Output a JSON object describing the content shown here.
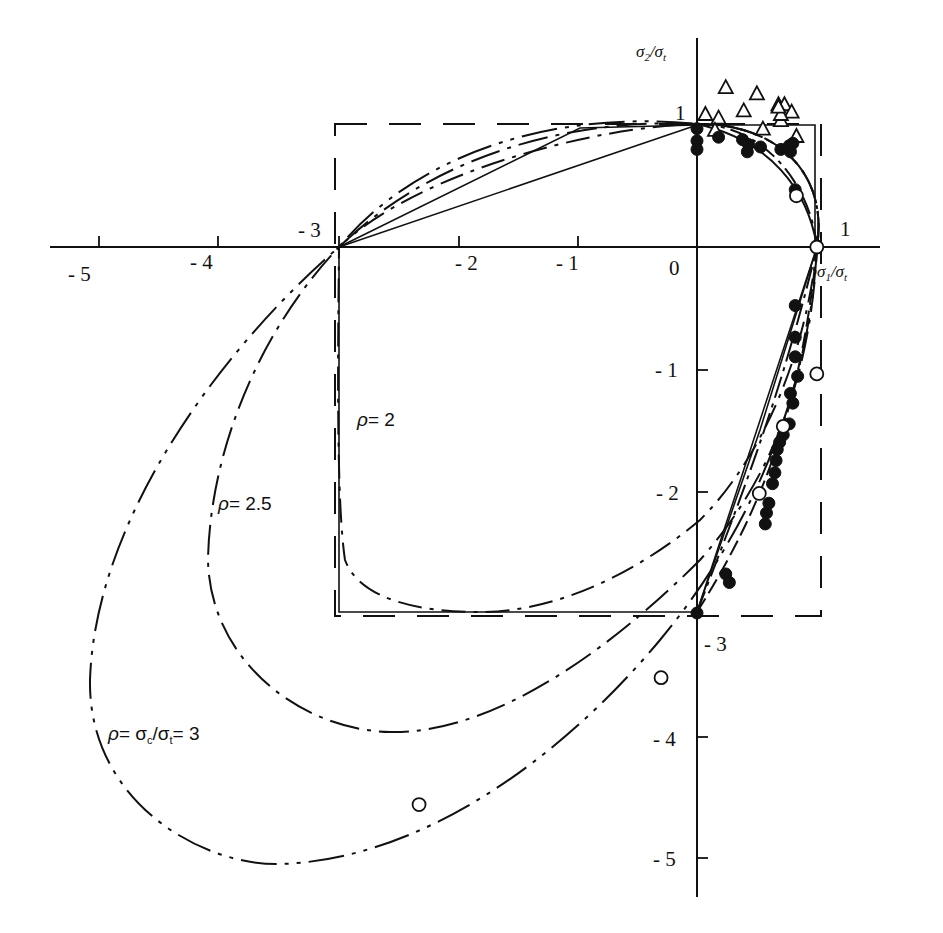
{
  "chart_data": {
    "type": "scatter",
    "title": "",
    "xlabel": "σ1/σt",
    "ylabel": "σ2/σt",
    "xlim": [
      -5.3,
      1.45
    ],
    "ylim": [
      -5.4,
      1.35
    ],
    "grid": false,
    "legend": null,
    "x_ticks": [
      -5,
      -4,
      -3,
      -2,
      -1,
      0,
      1
    ],
    "x_tick_labels": [
      "- 5",
      "- 4",
      "- 3",
      "- 2",
      "- 1",
      "0",
      "1"
    ],
    "y_ticks": [
      1,
      -1,
      -2,
      -3,
      -4,
      -5
    ],
    "y_tick_labels": [
      "1",
      "- 1",
      "- 2",
      "- 3",
      "- 4",
      "- 5"
    ],
    "reference_box": {
      "style": "dashed",
      "x": [
        -3,
        1
      ],
      "y": [
        -3,
        1
      ]
    },
    "curves": [
      {
        "name": "ρ = 2",
        "style": "dash-dot",
        "label": "ρ = 2"
      },
      {
        "name": "ρ = 2.5",
        "style": "dash-dot",
        "label": "ρ = 2.5"
      },
      {
        "name": "ρ = σc/σt = 3",
        "style": "dash-dot",
        "label": "ρ = σc/σt = 3"
      }
    ],
    "series": [
      {
        "name": "open triangles",
        "marker": "triangle-open",
        "points": [
          [
            0.07,
            1.09
          ],
          [
            0.24,
            1.31
          ],
          [
            0.39,
            1.12
          ],
          [
            0.5,
            1.26
          ],
          [
            0.68,
            1.17
          ],
          [
            0.7,
            1.04
          ],
          [
            0.73,
            1.17
          ],
          [
            0.79,
            1.11
          ],
          [
            0.7,
            1.09
          ],
          [
            0.68,
            1.15
          ],
          [
            0.55,
            0.97
          ],
          [
            0.18,
            1.06
          ],
          [
            0.15,
            0.96
          ],
          [
            0.83,
            0.91
          ]
        ]
      },
      {
        "name": "filled circles",
        "marker": "circle-filled",
        "points": [
          [
            0.0,
            0.97
          ],
          [
            0.0,
            0.87
          ],
          [
            0.0,
            0.8
          ],
          [
            0.18,
            0.9
          ],
          [
            0.38,
            0.88
          ],
          [
            0.43,
            0.84
          ],
          [
            0.42,
            0.78
          ],
          [
            0.53,
            0.82
          ],
          [
            0.7,
            0.8
          ],
          [
            0.77,
            0.83
          ],
          [
            0.8,
            0.85
          ],
          [
            0.78,
            0.78
          ],
          [
            0.82,
            0.47
          ],
          [
            0.82,
            -0.48
          ],
          [
            0.82,
            -0.74
          ],
          [
            0.82,
            -0.9
          ],
          [
            0.84,
            -1.06
          ],
          [
            0.78,
            -1.2
          ],
          [
            0.8,
            -1.28
          ],
          [
            0.77,
            -1.45
          ],
          [
            0.72,
            -1.54
          ],
          [
            0.69,
            -1.6
          ],
          [
            0.67,
            -1.66
          ],
          [
            0.66,
            -1.75
          ],
          [
            0.65,
            -1.85
          ],
          [
            0.63,
            -1.94
          ],
          [
            0.6,
            -2.1
          ],
          [
            0.58,
            -2.18
          ],
          [
            0.57,
            -2.27
          ],
          [
            0.24,
            -2.68
          ],
          [
            0.27,
            -2.75
          ],
          [
            0.0,
            -3.0
          ]
        ]
      },
      {
        "name": "open circles",
        "marker": "circle-open",
        "points": [
          [
            0.83,
            0.42
          ],
          [
            1.0,
            0.0
          ],
          [
            1.0,
            -1.04
          ],
          [
            0.72,
            -1.47
          ],
          [
            0.52,
            -2.02
          ],
          [
            -0.3,
            -3.53
          ],
          [
            -2.32,
            -4.57
          ]
        ]
      }
    ]
  },
  "axes": {
    "x_title_main": "σ",
    "x_title_sub1": "1",
    "x_title_mid": "/σ",
    "x_title_sub2": "t",
    "y_title_main": "σ",
    "y_title_sub1": "2",
    "y_title_mid": "/σ",
    "y_title_sub2": "t"
  },
  "labels": {
    "rho2": "= 2",
    "rho25": "= 2.5",
    "rho3_mid": "= σ",
    "rho3_sub": "c",
    "rho3_mid2": "/σ",
    "rho3_sub2": "t",
    "rho3_end": "= 3",
    "rho_symbol": "ρ"
  },
  "ticks": {
    "x_m5": "- 5",
    "x_m4": "- 4",
    "x_m3": "- 3",
    "x_m2": "- 2",
    "x_m1": "- 1",
    "x_0": "0",
    "x_1": "1",
    "y_1": "1",
    "y_m1": "- 1",
    "y_m2": "- 2",
    "y_m3": "- 3",
    "y_m4": "- 4",
    "y_m5": "- 5"
  }
}
